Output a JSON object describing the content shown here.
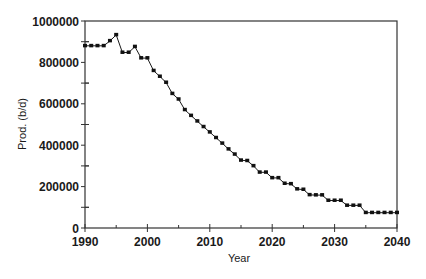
{
  "chart_data": {
    "type": "line",
    "title": "",
    "xlabel": "Year",
    "ylabel": "Prod. (b/d)",
    "xlim": [
      1990,
      2040
    ],
    "ylim": [
      0,
      1000000
    ],
    "x_ticks": [
      1990,
      2000,
      2010,
      2020,
      2030,
      2040
    ],
    "x_tick_labels": [
      "1990",
      "2000",
      "2010",
      "2020",
      "2030",
      "2040"
    ],
    "x_minor_step": 5,
    "y_ticks": [
      0,
      200000,
      400000,
      600000,
      800000,
      1000000
    ],
    "y_tick_labels": [
      "0",
      "200000",
      "400000",
      "600000",
      "800000",
      "1000000"
    ],
    "y_minor_step": 100000,
    "grid": false,
    "legend": null,
    "markers": "square",
    "series": [
      {
        "name": "Production",
        "x": [
          1990,
          1991,
          1992,
          1993,
          1994,
          1995,
          1996,
          1997,
          1998,
          1999,
          2000,
          2001,
          2002,
          2003,
          2004,
          2005,
          2006,
          2007,
          2008,
          2009,
          2010,
          2011,
          2012,
          2013,
          2014,
          2015,
          2016,
          2017,
          2018,
          2019,
          2020,
          2021,
          2022,
          2023,
          2024,
          2025,
          2026,
          2027,
          2028,
          2029,
          2030,
          2031,
          2032,
          2033,
          2034,
          2035,
          2036,
          2037,
          2038,
          2039,
          2040
        ],
        "values": [
          880000,
          880000,
          880000,
          880000,
          904000,
          933000,
          848000,
          848000,
          876000,
          821000,
          821000,
          760000,
          732000,
          703000,
          649000,
          622000,
          571000,
          543000,
          516000,
          489000,
          463000,
          436000,
          409000,
          381000,
          356000,
          327000,
          325000,
          300000,
          269000,
          269000,
          242000,
          242000,
          215000,
          213000,
          188000,
          186000,
          160000,
          159000,
          159000,
          133000,
          133000,
          133000,
          109000,
          109000,
          109000,
          74000,
          74000,
          74000,
          74000,
          74000,
          74000
        ]
      }
    ]
  },
  "colors": {
    "line": "#1a1a1a",
    "marker": "#111111",
    "axis": "#333333",
    "background": "#ffffff"
  }
}
